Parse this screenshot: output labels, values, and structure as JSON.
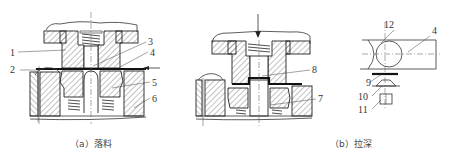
{
  "figure": {
    "subfigures": [
      {
        "id": "a",
        "caption": "（a）落料"
      },
      {
        "id": "b",
        "caption": "（b）拉深"
      }
    ],
    "labels": {
      "l1": "1",
      "l2": "2",
      "l3": "3",
      "l4": "4",
      "l5": "5",
      "l6": "6",
      "l7": "7",
      "l8": "8",
      "l9": "9",
      "l10": "10",
      "l11": "11",
      "l12": "12",
      "l4b": "4"
    },
    "colors": {
      "line": "#222222",
      "background": "#ffffff"
    }
  }
}
